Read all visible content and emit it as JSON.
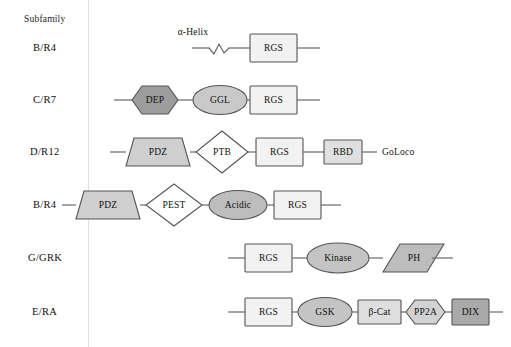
{
  "figure": {
    "kind": "domain-architecture-diagram",
    "column_header": "Subfamily",
    "divider_color": "#dedede",
    "connector_color": "#6f6f6f",
    "shape_outline_color": "#545454"
  },
  "palette": {
    "rgs_fill": "#f2f2f2",
    "white_fill": "#ffffff",
    "light_gray_fill": "#e2e2e2",
    "mid_light_fill": "#d2d2d2",
    "mid_gray_fill": "#bdbdbd",
    "dark_gray_fill": "#9d9d9d",
    "dix_fill": "#a9a9a9"
  },
  "rows": [
    {
      "label": "B/R4",
      "annotation": "α-Helix",
      "domains": [
        {
          "name": "RGS",
          "shape": "rect",
          "fill": "#f2f2f2"
        }
      ]
    },
    {
      "label": "C/R7",
      "domains": [
        {
          "name": "DEP",
          "shape": "hexagon",
          "fill": "#9d9d9d"
        },
        {
          "name": "GGL",
          "shape": "ellipse",
          "fill": "#c9c9c9"
        },
        {
          "name": "RGS",
          "shape": "rect",
          "fill": "#f2f2f2"
        }
      ]
    },
    {
      "label": "D/R12",
      "domains": [
        {
          "name": "PDZ",
          "shape": "trapezoid",
          "fill": "#cfcfcf"
        },
        {
          "name": "PTB",
          "shape": "diamond",
          "fill": "#ffffff"
        },
        {
          "name": "RGS",
          "shape": "rect",
          "fill": "#f2f2f2"
        },
        {
          "name": "RBD",
          "shape": "rect",
          "fill": "#e0e0e0"
        }
      ],
      "tail_label": "GoLoco"
    },
    {
      "label": "B/R4",
      "domains": [
        {
          "name": "PDZ",
          "shape": "trapezoid",
          "fill": "#cfcfcf"
        },
        {
          "name": "PEST",
          "shape": "diamond",
          "fill": "#ffffff"
        },
        {
          "name": "Acidic",
          "shape": "ellipse",
          "fill": "#bdbdbd"
        },
        {
          "name": "RGS",
          "shape": "rect",
          "fill": "#f2f2f2"
        }
      ]
    },
    {
      "label": "G/GRK",
      "domains": [
        {
          "name": "RGS",
          "shape": "rect",
          "fill": "#f2f2f2"
        },
        {
          "name": "Kinase",
          "shape": "ellipse",
          "fill": "#c4c4c4"
        },
        {
          "name": "PH",
          "shape": "parallelogram",
          "fill": "#bdbdbd"
        }
      ]
    },
    {
      "label": "E/RA",
      "domains": [
        {
          "name": "RGS",
          "shape": "rect",
          "fill": "#f2f2f2"
        },
        {
          "name": "GSK",
          "shape": "ellipse",
          "fill": "#c4c4c4"
        },
        {
          "name": "β-Cat",
          "shape": "rect",
          "fill": "#dedede"
        },
        {
          "name": "PP2A",
          "shape": "hexagon",
          "fill": "#d2d2d2"
        },
        {
          "name": "DIX",
          "shape": "rect",
          "fill": "#a9a9a9"
        }
      ]
    }
  ]
}
